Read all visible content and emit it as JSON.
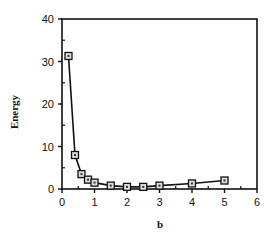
{
  "chart_data": {
    "type": "line",
    "title": "",
    "xlabel": "b",
    "ylabel": "Energy",
    "xlim": [
      0,
      6
    ],
    "ylim": [
      0,
      40
    ],
    "xticks": [
      0,
      1,
      2,
      3,
      4,
      5,
      6
    ],
    "yticks": [
      0,
      10,
      20,
      30,
      40
    ],
    "grid": false,
    "legend": null,
    "marker": "square",
    "series": [
      {
        "name": "Energy",
        "x": [
          0.2,
          0.4,
          0.6,
          0.8,
          1.0,
          1.5,
          2.0,
          2.5,
          3.0,
          4.0,
          5.0
        ],
        "y": [
          31.3,
          8.0,
          3.5,
          2.2,
          1.5,
          0.8,
          0.5,
          0.5,
          0.8,
          1.3,
          2.0
        ]
      }
    ]
  },
  "labels": {
    "xlabel": "b",
    "ylabel": "Energy",
    "xticks": [
      "0",
      "1",
      "2",
      "3",
      "4",
      "5",
      "6"
    ],
    "yticks": [
      "0",
      "10",
      "20",
      "30",
      "40"
    ]
  }
}
